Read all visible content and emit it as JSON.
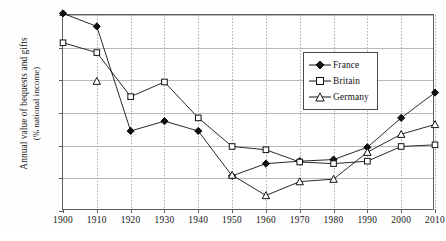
{
  "chart_data": {
    "type": "line",
    "title": "",
    "xlabel": "",
    "ylabel": "Annual value of bequests and gifts",
    "ylabel_line2": "(% national income)",
    "categories": [
      "1900",
      "1910",
      "1920",
      "1930",
      "1940",
      "1950",
      "1960",
      "1970",
      "1980",
      "1990",
      "2000",
      "2010"
    ],
    "x": [
      1900,
      1910,
      1920,
      1930,
      1940,
      1950,
      1960,
      1970,
      1980,
      1990,
      2000,
      2010
    ],
    "xlim": [
      1900,
      2010
    ],
    "ylim": [
      0,
      24
    ],
    "yticks": [
      0,
      4,
      8,
      12,
      16,
      20,
      24
    ],
    "ytick_labels": [
      "0%",
      "4%",
      "8%",
      "12%",
      "16%",
      "20%",
      "24%"
    ],
    "xtick_labels": [
      "1900",
      "1910",
      "1920",
      "1930",
      "1940",
      "1950",
      "1960",
      "1970",
      "1980",
      "1990",
      "2000",
      "2010"
    ],
    "grid": "horizontal-and-vertical",
    "legend_position": "top-center",
    "series": [
      {
        "name": "France",
        "marker": "filled-diamond",
        "color": "#111111",
        "values": [
          24.2,
          22.6,
          9.8,
          11.0,
          9.8,
          4.3,
          5.8,
          6.1,
          6.3,
          7.8,
          11.4,
          14.5
        ]
      },
      {
        "name": "Britain",
        "marker": "open-square",
        "color": "#111111",
        "values": [
          20.6,
          19.4,
          14.0,
          15.8,
          11.4,
          7.9,
          7.5,
          6.0,
          5.8,
          6.1,
          7.9,
          8.1
        ]
      },
      {
        "name": "Germany",
        "marker": "open-triangle",
        "color": "#111111",
        "values": [
          null,
          15.9,
          null,
          null,
          null,
          4.4,
          1.9,
          3.6,
          3.9,
          7.2,
          9.4,
          10.6
        ]
      }
    ]
  },
  "legend": {
    "items": [
      {
        "label": "France"
      },
      {
        "label": "Britain"
      },
      {
        "label": "Germany"
      }
    ]
  },
  "axis": {
    "y_title_line1": "Annual value of bequests and gifts",
    "y_title_line2": "(% national income)"
  }
}
